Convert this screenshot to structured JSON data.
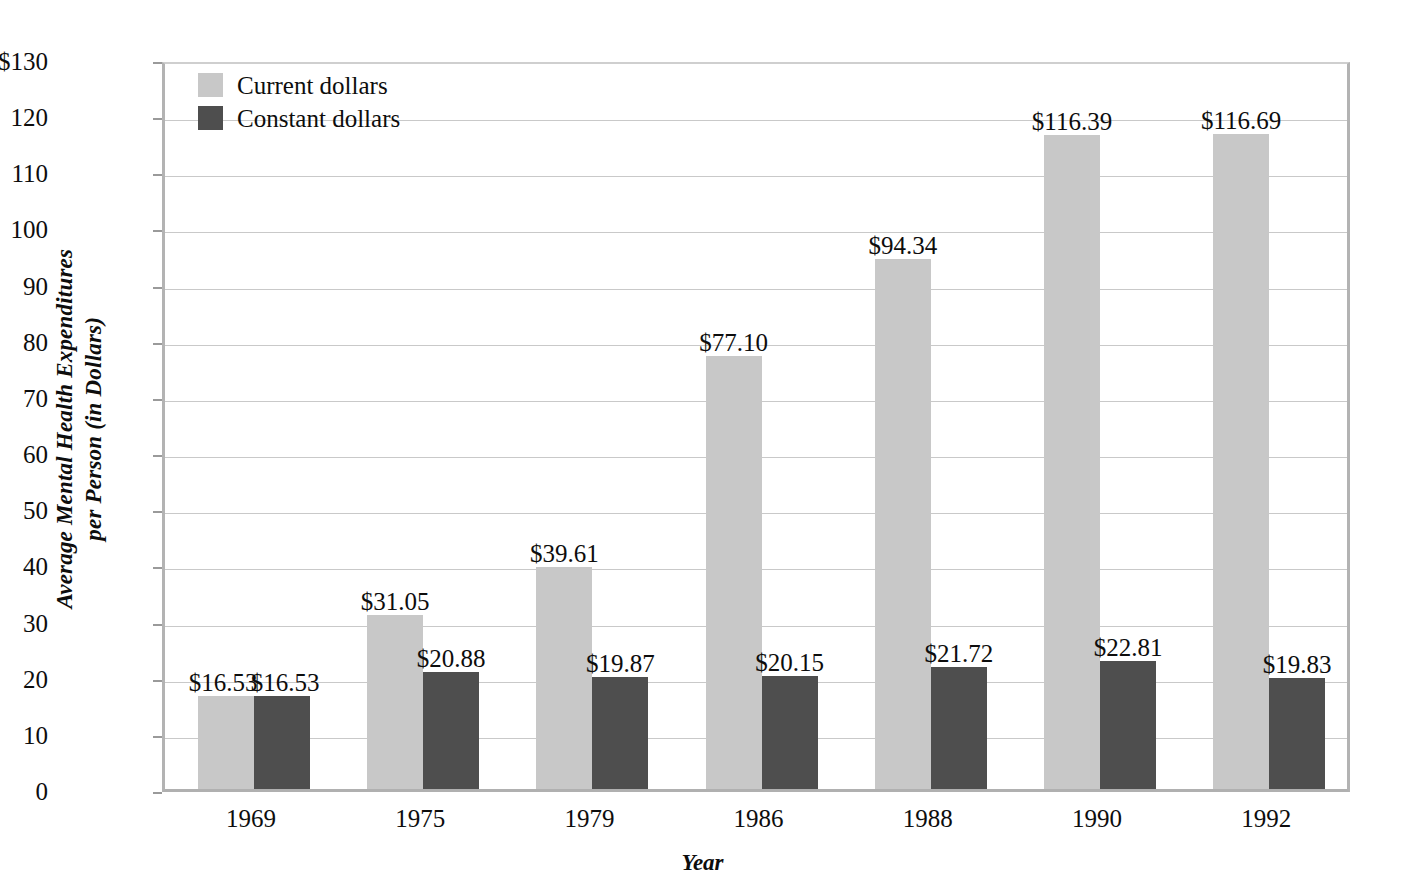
{
  "chart_data": {
    "type": "bar",
    "title": "",
    "xlabel": "Year",
    "ylabel": "Average Mental Health Expenditures per Person (in Dollars)",
    "ylabel_lines": [
      "Average Mental Health Expenditures",
      "per Person (in Dollars)"
    ],
    "categories": [
      "1969",
      "1975",
      "1979",
      "1986",
      "1988",
      "1990",
      "1992"
    ],
    "series": [
      {
        "name": "Current dollars",
        "color": "#c8c8c8",
        "values": [
          16.53,
          31.05,
          39.61,
          77.1,
          94.34,
          116.39,
          116.69
        ],
        "labels": [
          "$16.53",
          "$31.05",
          "$39.61",
          "$77.10",
          "$94.34",
          "$116.39",
          "$116.69"
        ]
      },
      {
        "name": "Constant dollars",
        "color": "#4e4e4e",
        "values": [
          16.53,
          20.88,
          19.87,
          20.15,
          21.72,
          22.81,
          19.83
        ],
        "labels": [
          "$16.53",
          "$20.88",
          "$19.87",
          "$20.15",
          "$21.72",
          "$22.81",
          "$19.83"
        ]
      }
    ],
    "ylim": [
      0,
      130
    ],
    "ytick_values": [
      130,
      120,
      110,
      100,
      90,
      80,
      70,
      60,
      50,
      40,
      30,
      20,
      10,
      0
    ],
    "ytick_labels": [
      "$130",
      "120",
      "110",
      "100",
      "90",
      "80",
      "70",
      "60",
      "50",
      "40",
      "30",
      "20",
      "10",
      "0"
    ],
    "grid": true,
    "legend_position": "top-left-inside"
  },
  "legend": {
    "items": [
      {
        "label": "Current dollars",
        "swatch": "current"
      },
      {
        "label": "Constant dollars",
        "swatch": "constant"
      }
    ]
  }
}
